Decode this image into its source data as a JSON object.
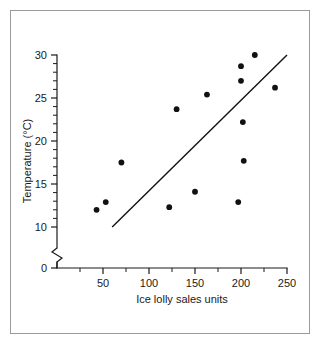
{
  "chart_data": {
    "type": "scatter",
    "title": "",
    "xlabel": "Ice lolly sales units",
    "ylabel": "Temperature (°C)",
    "xlim": [
      0,
      250
    ],
    "ylim": [
      0,
      30
    ],
    "y_axis_break": true,
    "y_break_between": [
      0,
      10
    ],
    "grid": false,
    "legend": null,
    "x_ticks_major": [
      0,
      50,
      100,
      150,
      200,
      250
    ],
    "x_tick_labels": [
      "0",
      "50",
      "100",
      "150",
      "200",
      "250"
    ],
    "x_ticks_minor": [
      25,
      75,
      125,
      175,
      225
    ],
    "y_ticks_major": [
      0,
      10,
      15,
      20,
      25,
      30
    ],
    "y_tick_labels": [
      "0",
      "10",
      "15",
      "20",
      "25",
      "30"
    ],
    "y_ticks_minor": [
      11,
      12,
      13,
      14,
      16,
      17,
      18,
      19,
      21,
      22,
      23,
      24,
      26,
      27,
      28,
      29
    ],
    "points": [
      {
        "x": 43,
        "y": 12.0
      },
      {
        "x": 53,
        "y": 12.9
      },
      {
        "x": 70,
        "y": 17.5
      },
      {
        "x": 122,
        "y": 12.3
      },
      {
        "x": 130,
        "y": 23.7
      },
      {
        "x": 150,
        "y": 14.1
      },
      {
        "x": 163,
        "y": 25.4
      },
      {
        "x": 197,
        "y": 12.9
      },
      {
        "x": 200,
        "y": 28.7
      },
      {
        "x": 200,
        "y": 27.0
      },
      {
        "x": 202,
        "y": 22.2
      },
      {
        "x": 203,
        "y": 17.7
      },
      {
        "x": 215,
        "y": 30.0
      },
      {
        "x": 237,
        "y": 26.2
      }
    ],
    "trend_line": {
      "name": "line of best fit",
      "x1": 60,
      "y1": 10.0,
      "x2": 250,
      "y2": 30.0
    },
    "colors": {
      "point": "#111111",
      "line": "#111111",
      "axis": "#1a1a1a",
      "frame": "#9a9a9a",
      "background": "#ffffff"
    }
  }
}
